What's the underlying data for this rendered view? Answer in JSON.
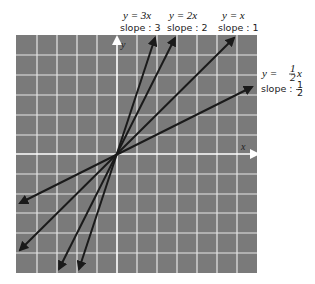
{
  "figure": {
    "background": "#7a7a7a",
    "grid_color": "#e8e8e8",
    "line_color": "#1a1a1a",
    "axis_arrow_color": "#ffffff",
    "axes": {
      "x_label": "x",
      "y_label": "y"
    }
  },
  "lines": [
    {
      "id": "y3x",
      "equation": "y = 3x",
      "slope_label": "slope : 3",
      "slope": 3
    },
    {
      "id": "y2x",
      "equation": "y = 2x",
      "slope_label": "slope : 2",
      "slope": 2
    },
    {
      "id": "yx",
      "equation": "y = x",
      "slope_label": "slope : 1",
      "slope": 1
    },
    {
      "id": "yhalfx",
      "equation_prefix": "y = ",
      "equation_frac_num": "1",
      "equation_frac_den": "2",
      "equation_suffix": "x",
      "slope_label_prefix": "slope : ",
      "slope_frac_num": "1",
      "slope_frac_den": "2",
      "slope": 0.5
    }
  ]
}
